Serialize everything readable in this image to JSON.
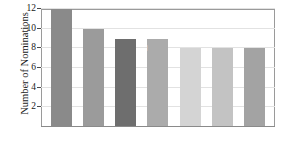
{
  "chart_data": {
    "type": "bar",
    "title": "",
    "xlabel": "",
    "ylabel": "Number of Nominations",
    "categories": [
      "Nicholson",
      "Olivier",
      "Newman",
      "Tracy",
      "Brando",
      "Lemmon",
      "Pacino"
    ],
    "values": [
      12,
      10,
      9,
      9,
      8,
      8,
      8
    ],
    "ylim": [
      0,
      12
    ],
    "yticks": [
      2,
      4,
      6,
      8,
      10,
      12
    ],
    "ytick_labels": [
      "2",
      "4",
      "6",
      "8",
      "10",
      "12"
    ],
    "grid": true,
    "legend": "none",
    "bar_colors": [
      "#8a8a8a",
      "#9b9b9b",
      "#6e6e6e",
      "#ababab",
      "#d4d4d4",
      "#c3c3c3",
      "#a3a3a3"
    ],
    "label_colors": [
      "#ffffff",
      "#ffffff",
      "#ffffff",
      "#ffffff",
      "#6b6b6b",
      "#6b6b6b",
      "#ffffff"
    ],
    "grid_color": "#e2e2e2",
    "axis_color": "#8a8a8a",
    "background": "#ffffff"
  }
}
